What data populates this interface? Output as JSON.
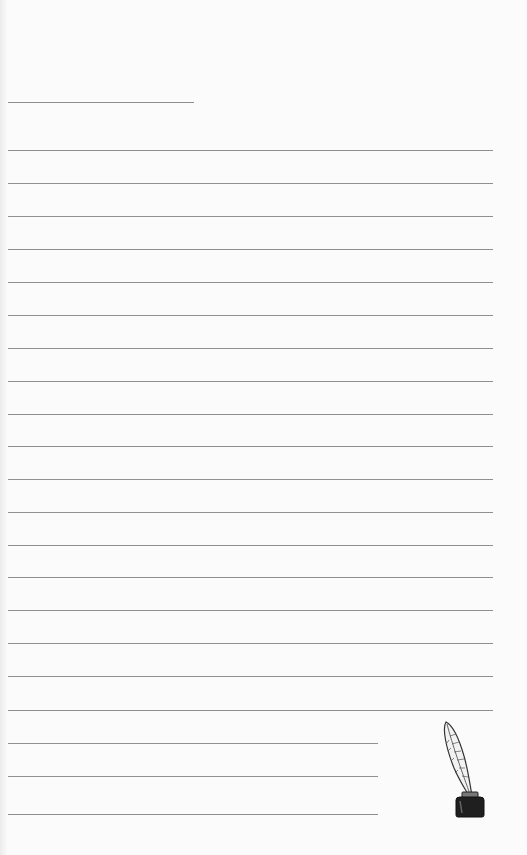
{
  "page": {
    "background": "#fbfbfb",
    "line_color": "#8f8f8f"
  },
  "lines": [
    {
      "y": 102,
      "x1": 8,
      "x2": 194
    },
    {
      "y": 150,
      "x1": 8,
      "x2": 493
    },
    {
      "y": 183,
      "x1": 8,
      "x2": 493
    },
    {
      "y": 216,
      "x1": 8,
      "x2": 493
    },
    {
      "y": 249,
      "x1": 8,
      "x2": 493
    },
    {
      "y": 282,
      "x1": 8,
      "x2": 493
    },
    {
      "y": 315,
      "x1": 8,
      "x2": 493
    },
    {
      "y": 348,
      "x1": 8,
      "x2": 493
    },
    {
      "y": 381,
      "x1": 8,
      "x2": 493
    },
    {
      "y": 414,
      "x1": 8,
      "x2": 493
    },
    {
      "y": 446,
      "x1": 8,
      "x2": 493
    },
    {
      "y": 479,
      "x1": 8,
      "x2": 493
    },
    {
      "y": 512,
      "x1": 8,
      "x2": 493
    },
    {
      "y": 545,
      "x1": 8,
      "x2": 493
    },
    {
      "y": 577,
      "x1": 8,
      "x2": 493
    },
    {
      "y": 610,
      "x1": 8,
      "x2": 493
    },
    {
      "y": 643,
      "x1": 8,
      "x2": 493
    },
    {
      "y": 676,
      "x1": 8,
      "x2": 493
    },
    {
      "y": 710,
      "x1": 8,
      "x2": 493
    },
    {
      "y": 743,
      "x1": 8,
      "x2": 378
    },
    {
      "y": 776,
      "x1": 8,
      "x2": 378
    },
    {
      "y": 814,
      "x1": 8,
      "x2": 378
    }
  ],
  "decoration": {
    "icon": "quill-and-inkwell-icon"
  }
}
